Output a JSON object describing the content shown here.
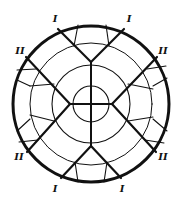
{
  "diagram": {
    "kind": "circular cross-section with zones",
    "colors": {
      "stroke": "#111111",
      "background": "#ffffff"
    },
    "labels": [
      {
        "id": "label-top-left",
        "text": "I",
        "x": 55,
        "y": 19
      },
      {
        "id": "label-top-right",
        "text": "I",
        "x": 129,
        "y": 19
      },
      {
        "id": "label-upper-left",
        "text": "II",
        "x": 20,
        "y": 51
      },
      {
        "id": "label-upper-right",
        "text": "II",
        "x": 163,
        "y": 51
      },
      {
        "id": "label-lower-left",
        "text": "II",
        "x": 19,
        "y": 157
      },
      {
        "id": "label-lower-right",
        "text": "II",
        "x": 163,
        "y": 157
      },
      {
        "id": "label-bottom-left",
        "text": "I",
        "x": 55,
        "y": 189
      },
      {
        "id": "label-bottom-right",
        "text": "I",
        "x": 122,
        "y": 189
      }
    ],
    "zones": [
      "I",
      "II"
    ]
  }
}
